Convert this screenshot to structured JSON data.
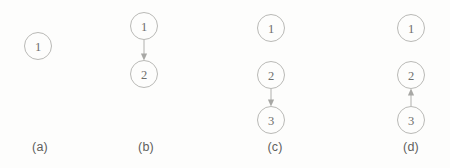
{
  "figure": {
    "width": 450,
    "height": 168,
    "background_color": "#fdfdfc",
    "node_stroke_color": "#b9b9b6",
    "node_fill_color": "#fdfdfc",
    "node_label_color": "#6e6e6b",
    "edge_color": "#b0b0ad",
    "caption_color": "#5f5f5d",
    "node_radius": 13.5
  },
  "chart_data": {
    "type": "diagram",
    "title": "",
    "panels": [
      {
        "caption": "(a)",
        "caption_x": 40,
        "caption_y": 148,
        "nodes": [
          {
            "label": "1",
            "x": 38,
            "y": 46
          }
        ],
        "edges": []
      },
      {
        "caption": "(b)",
        "caption_x": 146,
        "caption_y": 148,
        "nodes": [
          {
            "label": "1",
            "x": 144,
            "y": 26
          },
          {
            "label": "2",
            "x": 144,
            "y": 74
          }
        ],
        "edges": [
          {
            "from": "1",
            "to": "2",
            "direction": "down"
          }
        ]
      },
      {
        "caption": "(c)",
        "caption_x": 275,
        "caption_y": 148,
        "nodes": [
          {
            "label": "1",
            "x": 271,
            "y": 28
          },
          {
            "label": "2",
            "x": 271,
            "y": 75
          },
          {
            "label": "3",
            "x": 271,
            "y": 120
          }
        ],
        "edges": [
          {
            "from": "2",
            "to": "3",
            "direction": "down"
          }
        ]
      },
      {
        "caption": "(d)",
        "caption_x": 411,
        "caption_y": 148,
        "nodes": [
          {
            "label": "1",
            "x": 411,
            "y": 28
          },
          {
            "label": "2",
            "x": 411,
            "y": 75
          },
          {
            "label": "3",
            "x": 411,
            "y": 120
          }
        ],
        "edges": [
          {
            "from": "3",
            "to": "2",
            "direction": "up"
          }
        ]
      }
    ]
  }
}
